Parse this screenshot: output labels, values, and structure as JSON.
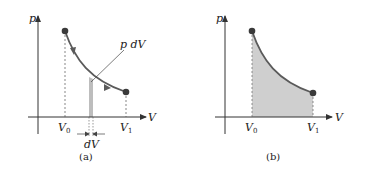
{
  "panels": [
    {
      "id": "a",
      "caption": "(a)",
      "y_axis_label": "p",
      "x_axis_label": "V",
      "v0_label": "V",
      "v0_sub": "0",
      "v1_label": "V",
      "v1_sub": "1",
      "annotation": "p dV",
      "strip_label": "dV",
      "shaded_region": "thin strip under curve",
      "curve_arrows": 2
    },
    {
      "id": "b",
      "caption": "(b)",
      "y_axis_label": "p",
      "x_axis_label": "V",
      "v0_label": "V",
      "v0_sub": "0",
      "v1_label": "V",
      "v1_sub": "1",
      "shaded_region": "full area under curve from V0 to V1"
    }
  ],
  "colors": {
    "curve": "#5a5a5a",
    "point": "#3a3a3a",
    "axis": "#333333",
    "shade": "#cfcfcf",
    "strip": "#bdbdbd"
  }
}
